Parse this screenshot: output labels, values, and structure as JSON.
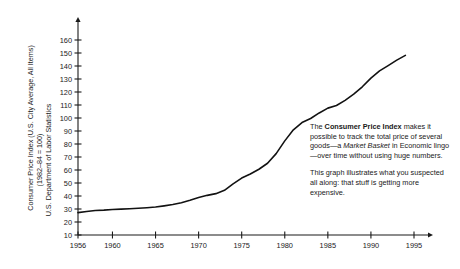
{
  "chart_data": {
    "type": "line",
    "title": "",
    "xlabel": "",
    "ylabel": "Consumer Price Index (U.S. City Average, All Items)",
    "ylabel_line2": "(1982–84 = 100)",
    "ylabel_line3": "U.S. Department of Labor Statistics",
    "xlim": [
      1956,
      1995
    ],
    "ylim": [
      10,
      165
    ],
    "grid": false,
    "legend": "none",
    "yticks": [
      10,
      20,
      30,
      40,
      50,
      60,
      70,
      80,
      90,
      100,
      110,
      120,
      130,
      140,
      150,
      160
    ],
    "ytick_labels": [
      "10",
      "20",
      "30",
      "40",
      "50",
      "60",
      "70",
      "80",
      "90",
      "100",
      "110",
      "120",
      "130",
      "140",
      "150",
      "160"
    ],
    "xticks": [
      1956,
      1960,
      1965,
      1970,
      1975,
      1980,
      1985,
      1990,
      1995
    ],
    "xtick_labels": [
      "1956",
      "1960",
      "1965",
      "1970",
      "1975",
      "1980",
      "1985",
      "1990",
      "1995"
    ],
    "series": [
      {
        "name": "Consumer Price Index",
        "x": [
          1956,
          1957,
          1958,
          1959,
          1960,
          1961,
          1962,
          1963,
          1964,
          1965,
          1966,
          1967,
          1968,
          1969,
          1970,
          1971,
          1972,
          1973,
          1974,
          1975,
          1976,
          1977,
          1978,
          1979,
          1980,
          1981,
          1982,
          1983,
          1984,
          1985,
          1986,
          1987,
          1988,
          1989,
          1990,
          1991,
          1992,
          1993,
          1994
        ],
        "values": [
          27.2,
          28.1,
          28.9,
          29.1,
          29.6,
          29.9,
          30.2,
          30.6,
          31.0,
          31.5,
          32.4,
          33.4,
          34.8,
          36.7,
          38.8,
          40.5,
          41.8,
          44.4,
          49.3,
          53.8,
          56.9,
          60.6,
          65.2,
          72.6,
          82.4,
          90.9,
          96.5,
          99.6,
          103.9,
          107.6,
          109.6,
          113.6,
          118.3,
          124.0,
          130.7,
          136.2,
          140.3,
          144.5,
          148.2
        ]
      }
    ],
    "annotations": {
      "paragraph1": {
        "part1": "The ",
        "bold1": "Consumer Price Index",
        "part2": " makes it possible to track the total price of several goods—a ",
        "italic1": "Market Basket",
        "part3": " in Economic lingo—over time without using huge numbers."
      },
      "paragraph2": "This graph illustrates what you suspected all along: that stuff is getting more expensive."
    }
  },
  "colors": {
    "line": "#121212",
    "axis": "#1a1a1a",
    "text": "#1a1a1a",
    "background": "#ffffff"
  }
}
